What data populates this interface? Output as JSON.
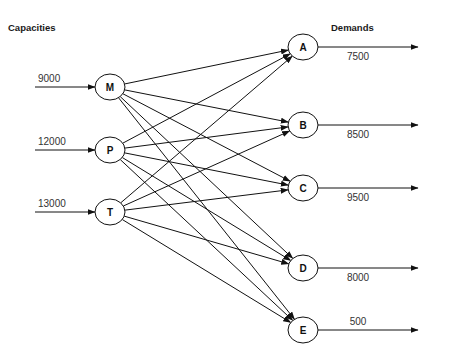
{
  "headings": {
    "capacities": "Capacities",
    "demands": "Demands"
  },
  "sources": [
    {
      "id": "M",
      "label": "M",
      "capacity": "9000",
      "cx": 110,
      "cy": 87
    },
    {
      "id": "P",
      "label": "P",
      "capacity": "12000",
      "cx": 110,
      "cy": 150
    },
    {
      "id": "T",
      "label": "T",
      "capacity": "13000",
      "cx": 110,
      "cy": 212
    }
  ],
  "destinations": [
    {
      "id": "A",
      "label": "A",
      "demand": "7500",
      "cx": 303,
      "cy": 47,
      "label_pos": "below"
    },
    {
      "id": "B",
      "label": "B",
      "demand": "8500",
      "cx": 303,
      "cy": 125,
      "label_pos": "below"
    },
    {
      "id": "C",
      "label": "C",
      "demand": "9500",
      "cx": 303,
      "cy": 188,
      "label_pos": "below"
    },
    {
      "id": "D",
      "label": "D",
      "demand": "8000",
      "cx": 303,
      "cy": 268,
      "label_pos": "below"
    },
    {
      "id": "E",
      "label": "E",
      "demand": "500",
      "cx": 303,
      "cy": 330,
      "label_pos": "above"
    }
  ],
  "edges": [
    [
      "M",
      "A"
    ],
    [
      "M",
      "B"
    ],
    [
      "M",
      "C"
    ],
    [
      "M",
      "D"
    ],
    [
      "M",
      "E"
    ],
    [
      "P",
      "A"
    ],
    [
      "P",
      "B"
    ],
    [
      "P",
      "C"
    ],
    [
      "P",
      "D"
    ],
    [
      "P",
      "E"
    ],
    [
      "T",
      "A"
    ],
    [
      "T",
      "B"
    ],
    [
      "T",
      "C"
    ],
    [
      "T",
      "D"
    ],
    [
      "T",
      "E"
    ]
  ],
  "colors": {
    "line": "#111111",
    "text": "#333333",
    "background": "#ffffff"
  }
}
